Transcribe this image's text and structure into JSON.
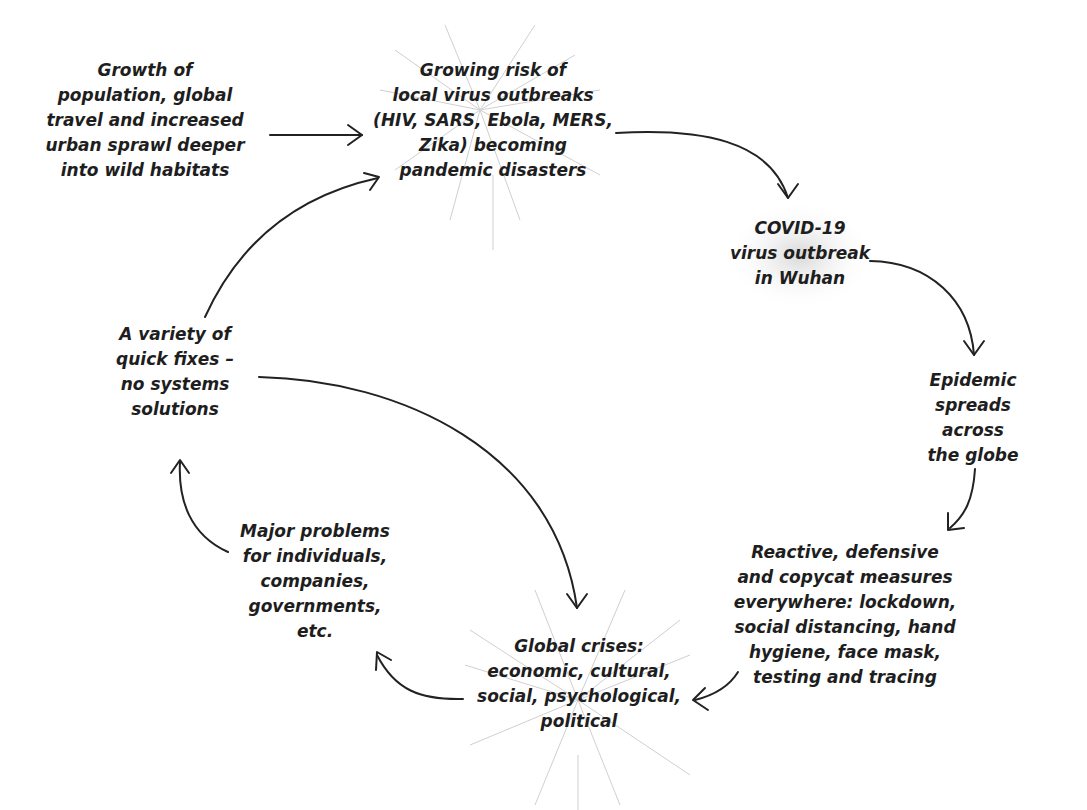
{
  "diagram": {
    "type": "cycle-flow",
    "nodes": [
      {
        "id": "growth",
        "label": "Growth of\npopulation, global\ntravel and increased\nurban sprawl deeper\ninto wild habitats"
      },
      {
        "id": "risk",
        "label": "Growing risk of\nlocal virus outbreaks\n(HIV, SARS, Ebola, MERS,\nZika) becoming\npandemic disasters"
      },
      {
        "id": "covid",
        "label": "COVID-19\nvirus outbreak\nin Wuhan"
      },
      {
        "id": "epidemic",
        "label": "Epidemic\nspreads across\nthe globe"
      },
      {
        "id": "reactive",
        "label": "Reactive, defensive\nand copycat measures\neverywhere: lockdown,\nsocial distancing, hand\nhygiene, face mask,\ntesting and tracing"
      },
      {
        "id": "crises",
        "label": "Global crises:\neconomic, cultural,\nsocial, psychological,\npolitical"
      },
      {
        "id": "problems",
        "label": "Major problems\nfor individuals,\ncompanies,\ngovernments,\netc."
      },
      {
        "id": "fixes",
        "label": "A variety of\nquick fixes –\nno systems\nsolutions"
      }
    ],
    "edges": [
      {
        "from": "growth",
        "to": "risk"
      },
      {
        "from": "risk",
        "to": "covid"
      },
      {
        "from": "covid",
        "to": "epidemic"
      },
      {
        "from": "epidemic",
        "to": "reactive"
      },
      {
        "from": "reactive",
        "to": "crises"
      },
      {
        "from": "crises",
        "to": "problems"
      },
      {
        "from": "problems",
        "to": "fixes"
      },
      {
        "from": "fixes",
        "to": "risk"
      },
      {
        "from": "fixes",
        "to": "crises"
      }
    ],
    "colors": {
      "text": "#1e1e1e",
      "arrow": "#222222",
      "burst": "#cfcfcf"
    }
  }
}
